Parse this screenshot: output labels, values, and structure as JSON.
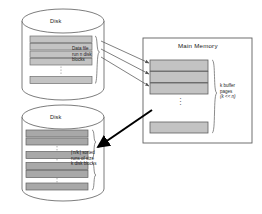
{
  "diagram": {
    "title_hidden": "External merge sort: disk to main memory buffer pages",
    "colors": {
      "outline": "#6e6e6e",
      "block_light": "#c3c3c3",
      "block_dark": "#a8a8a8",
      "arrow_thin": "#555555",
      "arrow_thick": "#000000",
      "text": "#1a1a1a",
      "background": "#ffffff"
    },
    "source_disk": {
      "label": "Disk",
      "annotation_lines": [
        "Data file",
        "run n disk",
        "blocks"
      ],
      "block_groups": [
        {
          "blocks": 4,
          "shade": "light"
        },
        {
          "blocks": 1,
          "shade": "light"
        }
      ]
    },
    "target_disk": {
      "label": "Disk",
      "annotation_lines": [
        "⌈n/k⌉ sorted",
        "runs of size",
        "k disk blocks"
      ],
      "block_groups": [
        {
          "blocks": 2,
          "shade": "dark"
        },
        {
          "blocks": 1,
          "shade": "dark"
        },
        {
          "blocks": 2,
          "shade": "dark"
        },
        {
          "blocks": 1,
          "shade": "dark"
        }
      ]
    },
    "main_memory": {
      "label": "Main Memory",
      "annotation_lines": [
        "k buffer",
        "pages",
        "(k << n)"
      ],
      "buffer_pages_shown": 4,
      "ellipsis": "⋮"
    },
    "arrows": {
      "read_count": 3,
      "write_count": 1,
      "read_direction": "disk-to-memory",
      "write_direction": "memory-to-disk"
    }
  }
}
